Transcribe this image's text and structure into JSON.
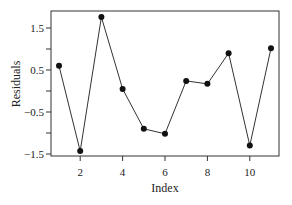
{
  "chart_data": {
    "type": "line",
    "title": "",
    "xlabel": "Index",
    "ylabel": "Residuals",
    "x": [
      1,
      2,
      3,
      4,
      5,
      6,
      7,
      8,
      9,
      10,
      11
    ],
    "series": [
      {
        "name": "Residuals",
        "values": [
          0.6,
          -1.43,
          1.76,
          0.05,
          -0.9,
          -1.02,
          0.24,
          0.17,
          0.9,
          -1.3,
          1.02
        ]
      }
    ],
    "xticks": [
      2,
      4,
      6,
      8,
      10
    ],
    "yticks": [
      -1.5,
      -1.0,
      -0.5,
      0.0,
      0.5,
      1.0,
      1.5
    ],
    "ytick_labels": [
      "-1.5",
      "",
      "-0.5",
      "",
      "0.5",
      "",
      "1.5"
    ],
    "xlim": [
      0.5,
      11.5
    ],
    "ylim": [
      -1.55,
      1.95
    ],
    "grid": false,
    "markers": true
  }
}
